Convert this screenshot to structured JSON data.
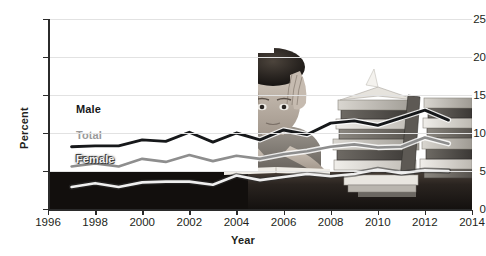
{
  "chart_data": {
    "type": "line",
    "title": "",
    "xlabel": "Year",
    "ylabel": "Percent",
    "xlim": [
      1996,
      2014
    ],
    "ylim": [
      0,
      25
    ],
    "yticks": [
      0,
      5,
      10,
      15,
      20,
      25
    ],
    "xticks": [
      1996,
      1998,
      2000,
      2002,
      2004,
      2006,
      2008,
      2010,
      2012,
      2014
    ],
    "grid": "horizontal",
    "legend_position": "inline-left",
    "x": [
      1997,
      1998,
      1999,
      2000,
      2001,
      2002,
      2003,
      2004,
      2005,
      2006,
      2007,
      2008,
      2009,
      2010,
      2011,
      2012,
      2013
    ],
    "series": [
      {
        "name": "Male",
        "color": "#16181a",
        "values": [
          8.2,
          8.3,
          8.3,
          9.1,
          8.9,
          10.1,
          8.8,
          10.0,
          9.1,
          10.4,
          9.8,
          11.3,
          11.6,
          11.0,
          12.0,
          13.0,
          11.7
        ]
      },
      {
        "name": "Total",
        "color": "#8e8e8e",
        "values": [
          5.6,
          6.0,
          5.6,
          6.6,
          6.2,
          7.1,
          6.3,
          7.0,
          6.6,
          7.2,
          7.6,
          8.2,
          8.5,
          8.1,
          8.2,
          9.4,
          8.6
        ]
      },
      {
        "name": "Female",
        "color": "#efefef",
        "values": [
          2.9,
          3.4,
          2.9,
          3.5,
          3.6,
          3.6,
          3.2,
          4.4,
          3.8,
          4.2,
          4.6,
          4.3,
          4.6,
          5.2,
          4.7,
          5.1,
          5.0
        ]
      }
    ],
    "series_labels": [
      {
        "name": "Male",
        "text": "Male"
      },
      {
        "name": "Total",
        "text": "Total"
      },
      {
        "name": "Female",
        "text": "Female"
      }
    ]
  },
  "axes": {
    "y_title": "Percent",
    "x_title": "Year",
    "y_tick_labels": [
      "0",
      "5",
      "10",
      "15",
      "20",
      "25"
    ],
    "x_tick_labels": [
      "1996",
      "1998",
      "2000",
      "2002",
      "2004",
      "2006",
      "2008",
      "2010",
      "2012",
      "2014"
    ]
  },
  "colors": {
    "male": "#16181a",
    "total": "#8e8e8e",
    "female": "#efefef",
    "axis": "#2b2b2b",
    "grid": "#e2e2e2",
    "text": "#231f20",
    "background": "#ffffff"
  },
  "background_image": {
    "description": "stressed-student-with-books-photo",
    "alt": "Grayscale photograph of a student holding their head beside tall stacks of books on a desk"
  }
}
